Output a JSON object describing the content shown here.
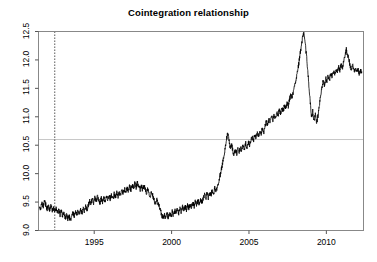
{
  "chart_data": {
    "type": "line",
    "title": "Cointegration relationship",
    "xlabel": "",
    "ylabel": "",
    "xlim": [
      1991.4,
      2012.4
    ],
    "ylim": [
      9.0,
      12.5
    ],
    "grid": false,
    "legend": null,
    "xticks": [
      1995,
      2000,
      2005,
      2010
    ],
    "xtick_labels": [
      "1995",
      "2000",
      "2005",
      "2010"
    ],
    "yticks": [
      9.0,
      9.5,
      10.0,
      10.5,
      11.0,
      11.5,
      12.0,
      12.5
    ],
    "ytick_labels": [
      "9.0",
      "9.5",
      "10.0",
      "10.5",
      "11.0",
      "11.5",
      "12.0",
      "12.5"
    ],
    "line_color": "#000000",
    "annotations": [
      {
        "name": "break-date-line",
        "type": "vline",
        "x": 1992.45,
        "style": "dotted",
        "color": "#333333"
      },
      {
        "name": "mean-level-line",
        "type": "hline",
        "y": 10.6,
        "style": "solid",
        "color": "#c8c8c8"
      }
    ],
    "series": [
      {
        "name": "cointegration residual",
        "x": [
          1991.45,
          1991.54,
          1991.62,
          1991.71,
          1991.79,
          1991.87,
          1991.96,
          1992.04,
          1992.12,
          1992.21,
          1992.29,
          1992.37,
          1992.46,
          1992.54,
          1992.62,
          1992.71,
          1992.79,
          1992.87,
          1992.96,
          1993.04,
          1993.12,
          1993.21,
          1993.29,
          1993.37,
          1993.46,
          1993.54,
          1993.62,
          1993.71,
          1993.79,
          1993.87,
          1993.96,
          1994.04,
          1994.12,
          1994.21,
          1994.29,
          1994.37,
          1994.46,
          1994.54,
          1994.62,
          1994.71,
          1994.79,
          1994.87,
          1994.96,
          1995.04,
          1995.12,
          1995.21,
          1995.29,
          1995.37,
          1995.46,
          1995.54,
          1995.62,
          1995.71,
          1995.79,
          1995.87,
          1995.96,
          1996.04,
          1996.12,
          1996.21,
          1996.29,
          1996.37,
          1996.46,
          1996.54,
          1996.62,
          1996.71,
          1996.79,
          1996.87,
          1996.96,
          1997.04,
          1997.12,
          1997.21,
          1997.29,
          1997.37,
          1997.46,
          1997.54,
          1997.62,
          1997.71,
          1997.79,
          1997.87,
          1997.96,
          1998.04,
          1998.12,
          1998.21,
          1998.29,
          1998.37,
          1998.46,
          1998.54,
          1998.62,
          1998.71,
          1998.79,
          1998.87,
          1998.96,
          1999.04,
          1999.12,
          1999.21,
          1999.29,
          1999.37,
          1999.46,
          1999.54,
          1999.62,
          1999.71,
          1999.79,
          1999.87,
          1999.96,
          2000.04,
          2000.12,
          2000.21,
          2000.29,
          2000.37,
          2000.46,
          2000.54,
          2000.62,
          2000.71,
          2000.79,
          2000.87,
          2000.96,
          2001.04,
          2001.12,
          2001.21,
          2001.29,
          2001.37,
          2001.46,
          2001.54,
          2001.62,
          2001.71,
          2001.79,
          2001.87,
          2001.96,
          2002.04,
          2002.12,
          2002.21,
          2002.29,
          2002.37,
          2002.46,
          2002.54,
          2002.62,
          2002.71,
          2002.79,
          2002.87,
          2002.96,
          2003.04,
          2003.12,
          2003.21,
          2003.29,
          2003.37,
          2003.46,
          2003.54,
          2003.62,
          2003.71,
          2003.79,
          2003.87,
          2003.96,
          2004.04,
          2004.12,
          2004.21,
          2004.29,
          2004.37,
          2004.46,
          2004.54,
          2004.62,
          2004.71,
          2004.79,
          2004.87,
          2004.96,
          2005.04,
          2005.12,
          2005.21,
          2005.29,
          2005.37,
          2005.46,
          2005.54,
          2005.62,
          2005.71,
          2005.79,
          2005.87,
          2005.96,
          2006.04,
          2006.12,
          2006.21,
          2006.29,
          2006.37,
          2006.46,
          2006.54,
          2006.62,
          2006.71,
          2006.79,
          2006.87,
          2006.96,
          2007.04,
          2007.12,
          2007.21,
          2007.29,
          2007.37,
          2007.46,
          2007.54,
          2007.62,
          2007.71,
          2007.79,
          2007.87,
          2007.96,
          2008.04,
          2008.12,
          2008.21,
          2008.29,
          2008.37,
          2008.46,
          2008.54,
          2008.62,
          2008.71,
          2008.79,
          2008.87,
          2008.96,
          2009.04,
          2009.12,
          2009.21,
          2009.29,
          2009.37,
          2009.46,
          2009.54,
          2009.62,
          2009.71,
          2009.79,
          2009.87,
          2009.96,
          2010.04,
          2010.12,
          2010.21,
          2010.29,
          2010.37,
          2010.46,
          2010.54,
          2010.62,
          2010.71,
          2010.79,
          2010.87,
          2010.96,
          2011.04,
          2011.12,
          2011.21,
          2011.29,
          2011.37,
          2011.46,
          2011.54,
          2011.62,
          2011.71,
          2011.79,
          2011.87,
          2011.96,
          2012.04,
          2012.12,
          2012.21,
          2012.29
        ],
        "y": [
          9.44,
          9.38,
          9.47,
          9.41,
          9.52,
          9.45,
          9.38,
          9.44,
          9.36,
          9.43,
          9.35,
          9.4,
          9.33,
          9.39,
          9.31,
          9.36,
          9.28,
          9.34,
          9.26,
          9.31,
          9.22,
          9.28,
          9.2,
          9.26,
          9.17,
          9.24,
          9.31,
          9.25,
          9.33,
          9.27,
          9.35,
          9.29,
          9.37,
          9.31,
          9.4,
          9.34,
          9.43,
          9.37,
          9.45,
          9.52,
          9.46,
          9.55,
          9.49,
          9.58,
          9.51,
          9.6,
          9.54,
          9.49,
          9.56,
          9.5,
          9.57,
          9.52,
          9.59,
          9.53,
          9.6,
          9.55,
          9.62,
          9.56,
          9.64,
          9.58,
          9.66,
          9.6,
          9.68,
          9.62,
          9.7,
          9.65,
          9.73,
          9.67,
          9.75,
          9.7,
          9.78,
          9.72,
          9.8,
          9.74,
          9.82,
          9.76,
          9.84,
          9.78,
          9.71,
          9.79,
          9.72,
          9.8,
          9.73,
          9.66,
          9.74,
          9.67,
          9.6,
          9.68,
          9.61,
          9.54,
          9.47,
          9.55,
          9.48,
          9.41,
          9.34,
          9.27,
          9.2,
          9.28,
          9.21,
          9.29,
          9.23,
          9.31,
          9.25,
          9.33,
          9.27,
          9.35,
          9.29,
          9.37,
          9.31,
          9.39,
          9.33,
          9.41,
          9.35,
          9.43,
          9.37,
          9.45,
          9.39,
          9.47,
          9.41,
          9.49,
          9.43,
          9.51,
          9.45,
          9.53,
          9.47,
          9.55,
          9.49,
          9.57,
          9.63,
          9.56,
          9.65,
          9.58,
          9.67,
          9.61,
          9.7,
          9.64,
          9.74,
          9.68,
          9.78,
          9.85,
          9.95,
          10.06,
          10.18,
          10.3,
          10.45,
          10.58,
          10.72,
          10.58,
          10.45,
          10.52,
          10.4,
          10.33,
          10.42,
          10.36,
          10.45,
          10.38,
          10.47,
          10.41,
          10.5,
          10.44,
          10.53,
          10.47,
          10.56,
          10.5,
          10.59,
          10.64,
          10.58,
          10.68,
          10.62,
          10.72,
          10.66,
          10.76,
          10.7,
          10.8,
          10.74,
          10.84,
          10.92,
          10.86,
          10.96,
          10.9,
          11.0,
          10.94,
          11.04,
          10.98,
          11.08,
          11.02,
          11.12,
          11.06,
          11.16,
          11.1,
          11.2,
          11.14,
          11.24,
          11.18,
          11.3,
          11.4,
          11.34,
          11.46,
          11.55,
          11.66,
          11.78,
          11.92,
          12.08,
          12.22,
          12.38,
          12.46,
          12.3,
          12.1,
          11.85,
          11.55,
          11.25,
          10.98,
          11.1,
          10.92,
          11.05,
          10.88,
          11.02,
          11.18,
          11.35,
          11.5,
          11.62,
          11.56,
          11.68,
          11.62,
          11.72,
          11.66,
          11.76,
          11.7,
          11.8,
          11.74,
          11.84,
          11.78,
          11.88,
          11.82,
          11.92,
          11.86,
          11.98,
          12.08,
          12.18,
          12.1,
          12.0,
          11.9,
          11.82,
          11.9,
          11.8,
          11.86,
          11.78,
          11.84,
          11.76,
          11.82,
          11.79
        ]
      }
    ]
  }
}
